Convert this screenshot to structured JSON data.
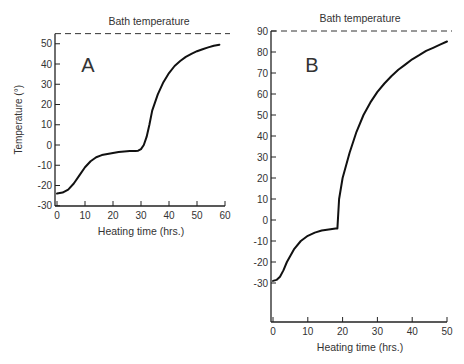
{
  "chart_data": [
    {
      "type": "line",
      "panel_label": "A",
      "title": "Bath temperature",
      "xlabel": "Heating time (hrs.)",
      "ylabel": "Temperature (°)",
      "xlim": [
        0,
        60
      ],
      "ylim": [
        -30,
        55
      ],
      "x_ticks": [
        0,
        10,
        20,
        30,
        40,
        50,
        60
      ],
      "y_ticks": [
        -30,
        -20,
        -10,
        0,
        10,
        20,
        30,
        40,
        50
      ],
      "bath_temperature": 55,
      "grid": false,
      "series": [
        {
          "name": "Sample temperature",
          "x": [
            0,
            2,
            4,
            6,
            8,
            10,
            12,
            14,
            16,
            18,
            20,
            22,
            24,
            26,
            28,
            29,
            30,
            31,
            32,
            33,
            34,
            36,
            38,
            40,
            42,
            44,
            46,
            48,
            50,
            52,
            54,
            56,
            58
          ],
          "y": [
            -24,
            -23.5,
            -22,
            -19,
            -15,
            -11,
            -8,
            -6,
            -5,
            -4.5,
            -4,
            -3.5,
            -3.2,
            -3,
            -3,
            -2.8,
            -2,
            0,
            4,
            10,
            17,
            25,
            31,
            35.5,
            39,
            41.5,
            43.5,
            45,
            46.3,
            47.3,
            48.2,
            49,
            49.5
          ]
        }
      ]
    },
    {
      "type": "line",
      "panel_label": "B",
      "title": "Bath temperature",
      "xlabel": "Heating time (hrs.)",
      "ylabel": "",
      "xlim": [
        0,
        50
      ],
      "ylim": [
        -35,
        90
      ],
      "x_ticks": [
        0,
        10,
        20,
        30,
        40,
        50
      ],
      "y_ticks": [
        -30,
        -20,
        -10,
        0,
        10,
        20,
        30,
        40,
        50,
        60,
        70,
        80,
        90
      ],
      "bath_temperature": 90,
      "grid": false,
      "series": [
        {
          "name": "Sample temperature",
          "x": [
            0,
            1,
            2,
            3,
            4,
            5,
            6,
            8,
            10,
            12,
            14,
            16,
            18,
            18.5,
            19,
            20,
            22,
            24,
            26,
            28,
            30,
            32,
            34,
            36,
            38,
            40,
            42,
            44,
            46,
            48,
            50
          ],
          "y": [
            -29,
            -28.5,
            -27,
            -24,
            -20,
            -17,
            -14,
            -10,
            -7.5,
            -6,
            -5,
            -4.5,
            -4,
            -4,
            10,
            20,
            32,
            42,
            50,
            56,
            61,
            65,
            68.5,
            71.5,
            74,
            76.5,
            78.5,
            80.5,
            82,
            83.5,
            85
          ]
        }
      ]
    }
  ]
}
